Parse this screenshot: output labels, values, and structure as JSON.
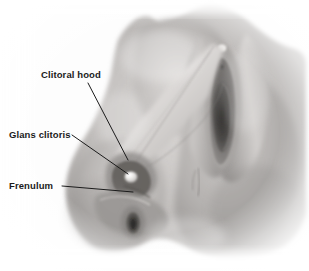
{
  "figure": {
    "type": "anatomical-illustration",
    "style": "grayscale airbrush medical illustration",
    "width": 309,
    "height": 271,
    "background_color": "#fdfdfd",
    "ink_color": "#1b1b1b",
    "skin_tone_light": "#e8e6e4",
    "skin_tone_mid": "#b5b2b0",
    "skin_tone_dark": "#6f6c6a",
    "skin_tone_deepest": "#3a3836"
  },
  "labels": [
    {
      "id": "clitoral-hood",
      "text": "Clitoral hood",
      "x": 41,
      "y": 69,
      "leader": {
        "x1": 88,
        "y1": 83,
        "x2": 128,
        "y2": 160
      }
    },
    {
      "id": "glans-clitoris",
      "text": "Glans clitoris",
      "x": 9,
      "y": 129,
      "leader": {
        "x1": 72,
        "y1": 135,
        "x2": 128,
        "y2": 174
      }
    },
    {
      "id": "frenulum",
      "text": "Frenulum",
      "x": 9,
      "y": 180,
      "leader": {
        "x1": 62,
        "y1": 186,
        "x2": 133,
        "y2": 192
      }
    }
  ],
  "structures": [
    {
      "id": "mons-pubis",
      "note": "upper body mass, top-left of vulva"
    },
    {
      "id": "labia-majora",
      "note": "outer folds framing the vestibule"
    },
    {
      "id": "labia-minora",
      "note": "inner folds, darker margin"
    },
    {
      "id": "vestibule",
      "note": "dark central aperture, upper right"
    },
    {
      "id": "vaginal-opening",
      "note": "lower dark aperture"
    },
    {
      "id": "clitoral-hood-flap",
      "note": "pale retracted wedge of tissue at center-left"
    },
    {
      "id": "glans-clitoris-bump",
      "note": "small bright rounded highlight at center"
    },
    {
      "id": "thigh-left",
      "note": "lower-left body mass"
    },
    {
      "id": "thigh-right",
      "note": "lower-right body mass"
    },
    {
      "id": "perineum-crease",
      "note": "faint vertical crease right of center"
    }
  ]
}
